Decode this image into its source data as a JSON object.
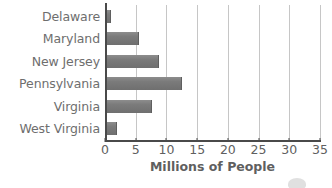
{
  "chart_data": {
    "type": "bar",
    "orientation": "horizontal",
    "title": "",
    "xlabel": "Millions of People",
    "ylabel": "",
    "categories": [
      "Delaware",
      "Maryland",
      "New Jersey",
      "Pennsylvania",
      "Virginia",
      "West Virginia"
    ],
    "values": [
      0.9,
      5.5,
      8.8,
      12.5,
      7.6,
      1.9
    ],
    "xlim": [
      0,
      35
    ],
    "xticks": [
      0,
      5,
      10,
      15,
      20,
      25,
      30,
      35
    ],
    "xtick_labels": [
      "0",
      "5",
      "10",
      "15",
      "20",
      "25",
      "30",
      "35"
    ],
    "grid": "vertical",
    "legend": "none",
    "bar_color": "#7b7b7b",
    "gridline_color": "#c6c6c6",
    "axis_color": "#4a4a4a",
    "label_color": "#6e6e6e"
  },
  "axis": {
    "x_title": "Millions of People"
  },
  "watermark": {
    "name": "partial-logo-artifact"
  }
}
